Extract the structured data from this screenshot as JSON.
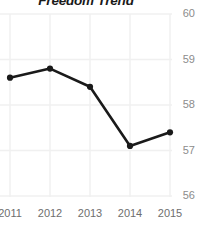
{
  "chart_data": {
    "type": "line",
    "title": "Freedom Trend",
    "xlabel": "",
    "ylabel": "",
    "categories": [
      "2011",
      "2012",
      "2013",
      "2014",
      "2015"
    ],
    "x": [
      2011,
      2012,
      2013,
      2014,
      2015
    ],
    "values": [
      58.6,
      58.8,
      58.4,
      57.1,
      57.4
    ],
    "series": [
      {
        "name": "Freedom Trend",
        "values": [
          58.6,
          58.8,
          58.4,
          57.1,
          57.4
        ]
      }
    ],
    "ylim": [
      56,
      60
    ],
    "xlim": [
      2011,
      2015
    ],
    "y_ticks": [
      56,
      57,
      58,
      59,
      60
    ],
    "y_tick_labels": [
      "56",
      "57",
      "58",
      "59",
      "60"
    ],
    "x_ticks": [
      2011,
      2012,
      2013,
      2014,
      2015
    ],
    "x_tick_labels": [
      "2011",
      "2012",
      "2013",
      "2014",
      "2015"
    ],
    "grid": true,
    "grid_axis": "both",
    "legend": false,
    "legend_position": "none",
    "markers": true,
    "marker_style": "circle",
    "y_axis_side": "right",
    "colors": {
      "line": "#1a1a1a",
      "marker": "#1a1a1a",
      "grid": "#f0f0f0",
      "background": "#ffffff",
      "title": "#1a1a1a",
      "y_tick": "#8c8c8c",
      "x_tick": "#6e6e6e"
    },
    "line_width": 2.6,
    "marker_size": 3.1
  }
}
